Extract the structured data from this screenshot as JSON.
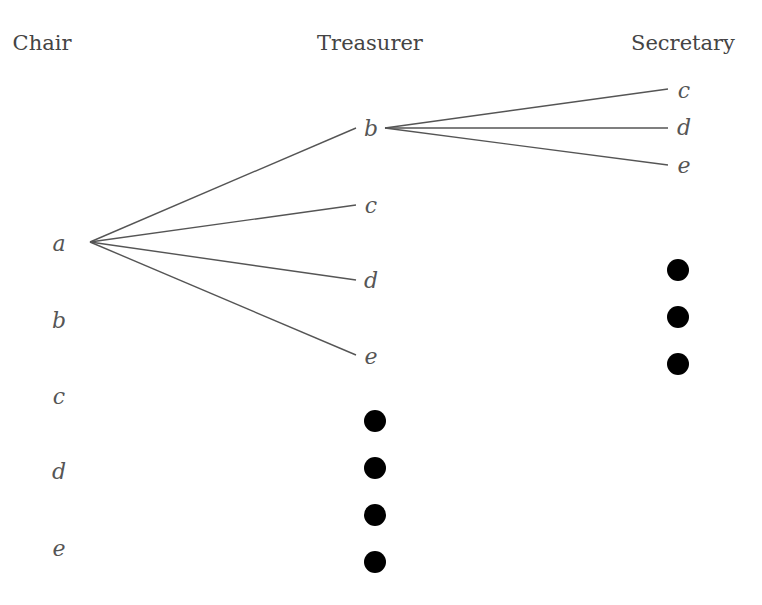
{
  "diagram": {
    "type": "tree",
    "columns": [
      {
        "id": "chair",
        "label": "Chair",
        "x": 42
      },
      {
        "id": "treasurer",
        "label": "Treasurer",
        "x": 370
      },
      {
        "id": "secretary",
        "label": "Secretary",
        "x": 683
      }
    ],
    "nodes": [
      {
        "id": "chair-a",
        "label": "a",
        "x": 59,
        "y": 251
      },
      {
        "id": "chair-b",
        "label": "b",
        "x": 59,
        "y": 328
      },
      {
        "id": "chair-c",
        "label": "c",
        "x": 59,
        "y": 404
      },
      {
        "id": "chair-d",
        "label": "d",
        "x": 59,
        "y": 479
      },
      {
        "id": "chair-e",
        "label": "e",
        "x": 59,
        "y": 556
      },
      {
        "id": "treasurer-b",
        "label": "b",
        "x": 371,
        "y": 136
      },
      {
        "id": "treasurer-c",
        "label": "c",
        "x": 371,
        "y": 213
      },
      {
        "id": "treasurer-d",
        "label": "d",
        "x": 371,
        "y": 288
      },
      {
        "id": "treasurer-e",
        "label": "e",
        "x": 371,
        "y": 364
      },
      {
        "id": "secretary-c",
        "label": "c",
        "x": 684,
        "y": 98
      },
      {
        "id": "secretary-d",
        "label": "d",
        "x": 684,
        "y": 135
      },
      {
        "id": "secretary-e",
        "label": "e",
        "x": 684,
        "y": 173
      }
    ],
    "edges": [
      {
        "from": "chair-a",
        "to": "treasurer-b",
        "x1": 90,
        "y1": 242,
        "x2": 356,
        "y2": 128
      },
      {
        "from": "chair-a",
        "to": "treasurer-c",
        "x1": 90,
        "y1": 242,
        "x2": 356,
        "y2": 205
      },
      {
        "from": "chair-a",
        "to": "treasurer-d",
        "x1": 90,
        "y1": 242,
        "x2": 356,
        "y2": 280
      },
      {
        "from": "chair-a",
        "to": "treasurer-e",
        "x1": 90,
        "y1": 242,
        "x2": 356,
        "y2": 355
      },
      {
        "from": "treasurer-b",
        "to": "secretary-c",
        "x1": 385,
        "y1": 128,
        "x2": 668,
        "y2": 89
      },
      {
        "from": "treasurer-b",
        "to": "secretary-d",
        "x1": 385,
        "y1": 128,
        "x2": 668,
        "y2": 128
      },
      {
        "from": "treasurer-b",
        "to": "secretary-e",
        "x1": 385,
        "y1": 128,
        "x2": 668,
        "y2": 165
      }
    ],
    "ellipses": [
      {
        "id": "treasurer-ellipsis",
        "column": "treasurer",
        "x": 375,
        "ys": [
          421,
          468,
          515,
          562
        ],
        "r": 11
      },
      {
        "id": "secretary-ellipsis",
        "column": "secretary",
        "x": 678,
        "ys": [
          270,
          317,
          364
        ],
        "r": 11
      }
    ]
  }
}
